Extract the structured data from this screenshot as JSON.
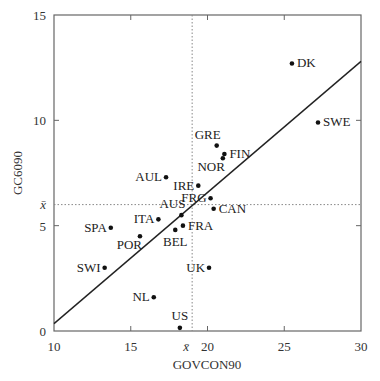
{
  "chart_data": {
    "type": "scatter",
    "title": "",
    "xlabel": "GOVCON90",
    "ylabel": "GC6090",
    "xlim": [
      10,
      30
    ],
    "ylim": [
      0,
      15
    ],
    "xticks": [
      10,
      15,
      20,
      25,
      30
    ],
    "yticks": [
      0,
      5,
      10,
      15
    ],
    "grid": false,
    "legend": null,
    "mean_lines": {
      "x_mean": 19.0,
      "y_mean": 6.0,
      "x_mean_label": "x̄",
      "y_mean_label": "x̄",
      "style": "dotted"
    },
    "regression_line": {
      "x": [
        10,
        30
      ],
      "y": [
        0.35,
        12.8
      ]
    },
    "points": [
      {
        "label": "DK",
        "x": 25.5,
        "y": 12.7,
        "label_pos": "right"
      },
      {
        "label": "SWE",
        "x": 27.2,
        "y": 9.9,
        "label_pos": "right"
      },
      {
        "label": "GRE",
        "x": 20.6,
        "y": 8.8,
        "label_pos": "above-left"
      },
      {
        "label": "FIN",
        "x": 21.1,
        "y": 8.4,
        "label_pos": "right"
      },
      {
        "label": "NOR",
        "x": 21.0,
        "y": 8.2,
        "label_pos": "below-left"
      },
      {
        "label": "AUL",
        "x": 17.3,
        "y": 7.3,
        "label_pos": "left"
      },
      {
        "label": "IRE",
        "x": 19.4,
        "y": 6.9,
        "label_pos": "left"
      },
      {
        "label": "FRG",
        "x": 20.2,
        "y": 6.3,
        "label_pos": "left"
      },
      {
        "label": "CAN",
        "x": 20.4,
        "y": 5.8,
        "label_pos": "right"
      },
      {
        "label": "AUS",
        "x": 18.3,
        "y": 5.5,
        "label_pos": "above-left"
      },
      {
        "label": "ITA",
        "x": 16.8,
        "y": 5.3,
        "label_pos": "left"
      },
      {
        "label": "FRA",
        "x": 18.4,
        "y": 5.0,
        "label_pos": "right"
      },
      {
        "label": "BEL",
        "x": 17.9,
        "y": 4.8,
        "label_pos": "below"
      },
      {
        "label": "SPA",
        "x": 13.7,
        "y": 4.9,
        "label_pos": "left"
      },
      {
        "label": "POR",
        "x": 15.6,
        "y": 4.5,
        "label_pos": "below-left"
      },
      {
        "label": "SWI",
        "x": 13.3,
        "y": 3.0,
        "label_pos": "left"
      },
      {
        "label": "UK",
        "x": 20.1,
        "y": 3.0,
        "label_pos": "left"
      },
      {
        "label": "NL",
        "x": 16.5,
        "y": 1.6,
        "label_pos": "left"
      },
      {
        "label": "US",
        "x": 18.2,
        "y": 0.15,
        "label_pos": "above"
      }
    ]
  }
}
